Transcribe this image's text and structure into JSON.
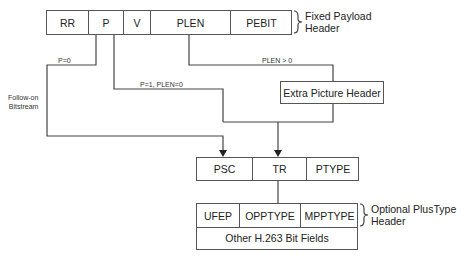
{
  "fixed_header": {
    "fields": [
      "RR",
      "P",
      "V",
      "PLEN",
      "PEBIT"
    ],
    "brace_label_line1": "Fixed Payload",
    "brace_label_line2": "Header"
  },
  "edges": {
    "p0": "P=0",
    "p1_plen0": "P=1, PLEN=0",
    "plen_gt0": "PLEN > 0",
    "follow_on_line1": "Follow-on",
    "follow_on_line2": "Bitstream"
  },
  "extra_picture_header": {
    "label": "Extra Picture Header"
  },
  "picture_header": {
    "fields": [
      "PSC",
      "TR",
      "PTYPE"
    ]
  },
  "plustype_header": {
    "fields": [
      "UFEP",
      "OPPTYPE",
      "MPPTYPE"
    ],
    "other": "Other H.263 Bit Fields",
    "brace_label_line1": "Optional PlusType",
    "brace_label_line2": "Header"
  }
}
